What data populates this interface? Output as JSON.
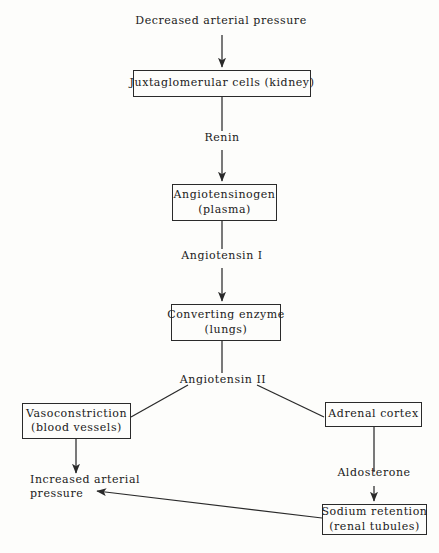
{
  "figure": {
    "background_color": "#fdfdfb",
    "line_color": "#2a2a2a",
    "text_color": "#1a1a1a"
  },
  "nodes": {
    "decreased_arterial_pressure": {
      "label": "Decreased arterial pressure",
      "boxed": false
    },
    "juxtaglomerular_cells": {
      "line1": "Juxtaglomerular cells (kidney)",
      "boxed": true
    },
    "angiotensinogen": {
      "line1": "Angiotensinogen",
      "line2": "(plasma)",
      "boxed": true
    },
    "converting_enzyme": {
      "line1": "Converting enzyme",
      "line2": "(lungs)",
      "boxed": true
    },
    "vasoconstriction": {
      "line1": "Vasoconstriction",
      "line2": "(blood vessels)",
      "boxed": true
    },
    "adrenal_cortex": {
      "line1": "Adrenal cortex",
      "boxed": true
    },
    "sodium_retention": {
      "line1": "Sodium retention",
      "line2": "(renal tubules)",
      "boxed": true
    },
    "increased_arterial_pressure": {
      "line1": "Increased arterial",
      "line2": "pressure",
      "boxed": false
    }
  },
  "edge_labels": {
    "renin": "Renin",
    "angiotensin_i": "Angiotensin I",
    "angiotensin_ii": "Angiotensin II",
    "aldosterone": "Aldosterone"
  }
}
